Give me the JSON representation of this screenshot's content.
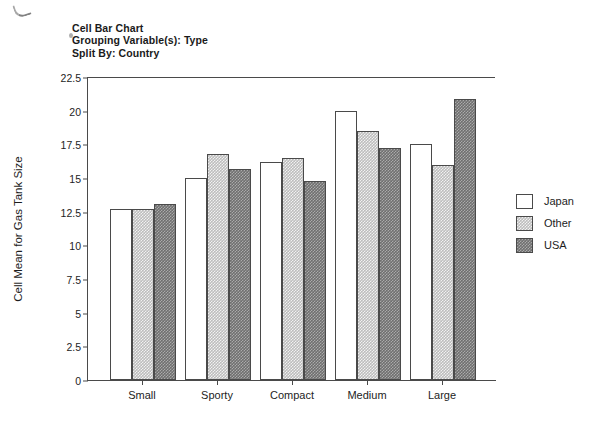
{
  "title": {
    "line1": "Cell Bar Chart",
    "line2": "Grouping Variable(s): Type",
    "line3": "Split By: Country"
  },
  "axes": {
    "y_label": "Cell Mean for Gas Tank Size",
    "y_ticks": [
      "22.5",
      "20",
      "17.5",
      "15",
      "12.5",
      "10",
      "7.5",
      "5",
      "2.5",
      "0"
    ],
    "x_label": ""
  },
  "legend": {
    "items": [
      {
        "label": "Japan",
        "key": "japan"
      },
      {
        "label": "Other",
        "key": "other"
      },
      {
        "label": "USA",
        "key": "usa"
      }
    ]
  },
  "chart_data": {
    "type": "bar",
    "title": "Cell Bar Chart",
    "subtitle": "Grouping Variable(s): Type / Split By: Country",
    "xlabel": "",
    "ylabel": "Cell Mean for Gas Tank Size",
    "ylim": [
      0,
      22.5
    ],
    "ytick_step": 2.5,
    "grid": false,
    "legend_position": "right",
    "categories": [
      "Small",
      "Sporty",
      "Compact",
      "Medium",
      "Large"
    ],
    "series": [
      {
        "name": "Japan",
        "color": "#ffffff",
        "values": [
          12.7,
          15.0,
          16.2,
          20.0,
          17.5
        ]
      },
      {
        "name": "Other",
        "color": "#bdbdbd",
        "values": [
          12.7,
          16.8,
          16.5,
          18.5,
          16.0
        ]
      },
      {
        "name": "USA",
        "color": "#6f6f6f",
        "values": [
          13.1,
          15.7,
          14.8,
          17.2,
          20.9
        ]
      }
    ]
  }
}
